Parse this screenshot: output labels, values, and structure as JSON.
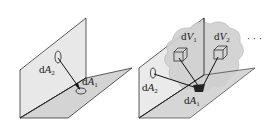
{
  "diagram": {
    "left_panel": {
      "labels": {
        "dA2": {
          "prefix": "d",
          "var": "A",
          "sub": "2"
        },
        "dA1": {
          "prefix": "d",
          "var": "A",
          "sub": "1"
        }
      }
    },
    "right_panel": {
      "labels": {
        "dV1": {
          "prefix": "d",
          "var": "V",
          "sub": "1"
        },
        "dV2": {
          "prefix": "d",
          "var": "V",
          "sub": "2"
        },
        "ellipsis": "· · ·",
        "dA2": {
          "prefix": "d",
          "var": "A",
          "sub": "2"
        },
        "dA1": {
          "prefix": "d",
          "var": "A",
          "sub": "1"
        }
      }
    },
    "colors": {
      "plane_fill": "#e6e6e6",
      "plane_floor": "#d2d2d2",
      "cloud_fill": "#cfcfcf",
      "line": "#222222"
    }
  }
}
